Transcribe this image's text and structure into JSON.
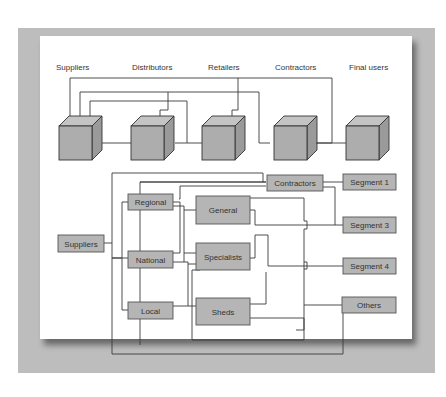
{
  "figure": {
    "top_row": {
      "labels": [
        "Suppliers",
        "Distributors",
        "Retailers",
        "Contractors",
        "Final users"
      ],
      "cubes": [
        "suppliers",
        "distributors",
        "retailers",
        "contractors",
        "final-users"
      ]
    },
    "bottom_tree": {
      "root": "Suppliers",
      "tier1": [
        "Regional",
        "National",
        "Local"
      ],
      "tier2": [
        "General",
        "Specialists",
        "Sheds"
      ],
      "contractors": "Contractors",
      "segments": [
        "Segment 1",
        "Segment 3",
        "Segment 4",
        "Others"
      ]
    },
    "colors": {
      "frame": "#bdbdbd",
      "box_fill": "#b5b5b5",
      "line": "#3a3a3a"
    }
  }
}
